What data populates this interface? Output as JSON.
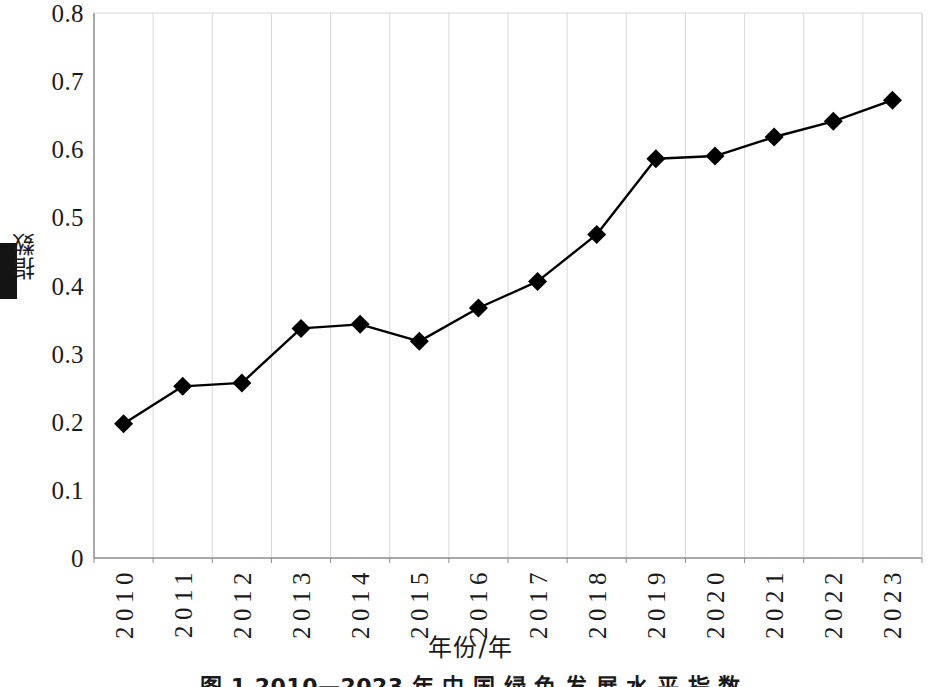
{
  "chart_data": {
    "type": "line",
    "title": "",
    "xlabel": "年份/年",
    "ylabel": "指数",
    "categories": [
      "2010",
      "2011",
      "2012",
      "2013",
      "2014",
      "2015",
      "2016",
      "2017",
      "2018",
      "2019",
      "2020",
      "2021",
      "2022",
      "2023"
    ],
    "values": [
      0.197,
      0.252,
      0.257,
      0.337,
      0.343,
      0.318,
      0.367,
      0.406,
      0.475,
      0.586,
      0.59,
      0.618,
      0.641,
      0.672
    ],
    "series": [
      {
        "name": "指数",
        "values": [
          0.197,
          0.252,
          0.257,
          0.337,
          0.343,
          0.318,
          0.367,
          0.406,
          0.475,
          0.586,
          0.59,
          0.618,
          0.641,
          0.672
        ]
      }
    ],
    "ylim": [
      0,
      0.8
    ],
    "yticks": [
      "0",
      "0.1",
      "0.2",
      "0.3",
      "0.4",
      "0.5",
      "0.6",
      "0.7",
      "0.8"
    ],
    "ytick_values": [
      0,
      0.1,
      0.2,
      0.3,
      0.4,
      0.5,
      0.6,
      0.7,
      0.8
    ],
    "grid": "vertical",
    "legend": "none",
    "marker": "diamond",
    "line_color": "#000000",
    "marker_color": "#000000",
    "grid_color": "#d8d8d8",
    "axis_color": "#9a9a9a"
  },
  "caption": {
    "text": "图 1  2010—2023 年 中 国 绿 色 发 展 水 平 指 数"
  }
}
